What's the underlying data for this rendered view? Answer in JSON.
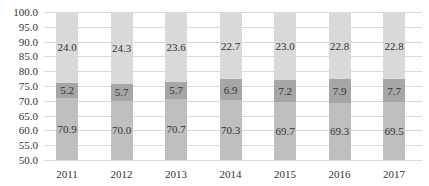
{
  "chart_data": {
    "type": "bar",
    "stacked": true,
    "title": "",
    "xlabel": "",
    "ylabel": "",
    "categories": [
      "2011",
      "2012",
      "2013",
      "2014",
      "2015",
      "2016",
      "2017"
    ],
    "series": [
      {
        "name": "Bottom segment",
        "color": "#bfbfbf",
        "values": [
          70.9,
          70.0,
          70.7,
          70.3,
          69.7,
          69.3,
          69.5
        ]
      },
      {
        "name": "Middle segment",
        "color": "#a6a6a6",
        "values": [
          5.2,
          5.7,
          5.7,
          6.9,
          7.2,
          7.9,
          7.7
        ]
      },
      {
        "name": "Top segment",
        "color": "#d9d9d9",
        "values": [
          24.0,
          24.3,
          23.6,
          22.7,
          23.0,
          22.8,
          22.8
        ]
      }
    ],
    "ylim": [
      50.0,
      100.0
    ],
    "yticks": [
      "100.0",
      "95.0",
      "90.0",
      "85.0",
      "80.0",
      "75.0",
      "70.0",
      "65.0",
      "60.0",
      "55.0",
      "50.0"
    ],
    "grid": true,
    "legend": "none"
  }
}
